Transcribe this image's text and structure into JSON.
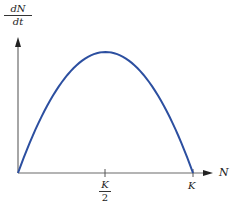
{
  "chart_data": {
    "type": "line",
    "title": "",
    "xlabel": "N",
    "ylabel": {
      "numerator": "dN",
      "denominator": "dt"
    },
    "x_ticks": [
      {
        "label_num": "K",
        "label_den": "2",
        "value": 0.5
      },
      {
        "label": "K",
        "value": 1.0
      }
    ],
    "series": [
      {
        "name": "dN/dt vs N (logistic growth)",
        "x": [
          0,
          0.1,
          0.2,
          0.3,
          0.4,
          0.5,
          0.6,
          0.7,
          0.8,
          0.9,
          1.0
        ],
        "values": [
          0,
          0.36,
          0.64,
          0.84,
          0.96,
          1.0,
          0.96,
          0.84,
          0.64,
          0.36,
          0
        ],
        "color": "#2c4fa0"
      }
    ],
    "xlim": [
      0,
      1.1
    ],
    "ylim": [
      0,
      1.15
    ],
    "grid": false,
    "legend": "none",
    "annotations": [
      "Maximum growth rate at N = K/2"
    ]
  },
  "colors": {
    "curve": "#2c4fa0",
    "axes": "#6b6b6b"
  }
}
